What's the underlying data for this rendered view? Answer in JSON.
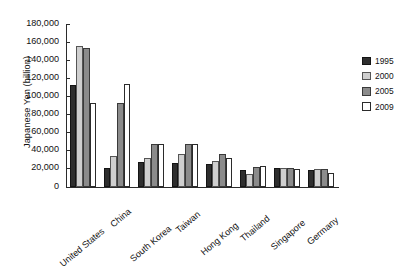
{
  "chart_data": {
    "type": "bar",
    "title": "",
    "subtitle": "",
    "xlabel": "",
    "ylabel": "Japanese Yen (billion)",
    "ylim": [
      0,
      180000
    ],
    "ytick_step": 20000,
    "ytick_labels": [
      "180,000",
      "160,000",
      "140,000",
      "120,000",
      "100,000",
      "80,000",
      "60,000",
      "40,000",
      "20,000",
      "0"
    ],
    "ytick_values": [
      180000,
      160000,
      140000,
      120000,
      100000,
      80000,
      60000,
      40000,
      20000,
      0
    ],
    "grid": false,
    "legend_position": "right",
    "categories": [
      "United States",
      "China",
      "South Korea",
      "Taiwan",
      "Hong Kong",
      "Thailand",
      "Singapore",
      "Germany"
    ],
    "series": [
      {
        "name": "1995",
        "color": "#2e2e2e",
        "values": [
          113000,
          20500,
          28000,
          26000,
          25000,
          19000,
          21000,
          19000
        ]
      },
      {
        "name": "2000",
        "color": "#cfcfcf",
        "values": [
          156000,
          34000,
          32000,
          37000,
          29000,
          14000,
          21000,
          20000
        ]
      },
      {
        "name": "2005",
        "color": "#8b8b8b",
        "values": [
          154000,
          93000,
          47000,
          48000,
          37000,
          22000,
          21000,
          20000
        ]
      },
      {
        "name": "2009",
        "color": "#ffffff",
        "values": [
          93000,
          114000,
          47000,
          47000,
          32000,
          23000,
          20000,
          15000
        ]
      }
    ]
  },
  "legend": {
    "items": [
      {
        "label": "1995"
      },
      {
        "label": "2000"
      },
      {
        "label": "2005"
      },
      {
        "label": "2009"
      }
    ]
  }
}
